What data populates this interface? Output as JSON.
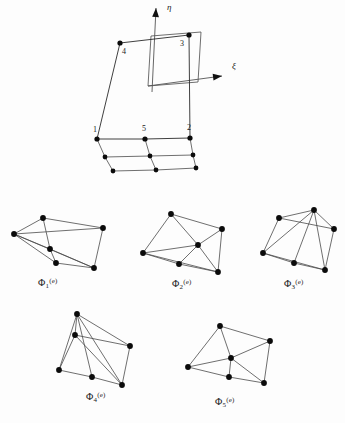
{
  "figure": {
    "background_color": "#fdfdfd",
    "line_color": "#4a4a4a",
    "node_color": "#0b0b0b"
  },
  "main_diagram": {
    "name": "parent-element-with-axes",
    "axes": [
      {
        "id": "eta",
        "label": "η",
        "label_x": 167,
        "label_y": 10,
        "x1": 152,
        "y1": 92,
        "x2": 156,
        "y2": 8,
        "arrow": "up"
      },
      {
        "id": "xi",
        "label": "ξ",
        "label_x": 232,
        "label_y": 69,
        "x1": 148,
        "y1": 86,
        "x2": 222,
        "y2": 76,
        "arrow": "right"
      }
    ],
    "inner_square": {
      "x1": 148,
      "y1": 86,
      "x2": 151,
      "y2": 36,
      "x3": 201,
      "y3": 32,
      "x4": 198,
      "y4": 82
    },
    "top_face": [
      {
        "id": "1",
        "label": "1",
        "x": 97,
        "y": 139,
        "label_x": 93,
        "label_y": 132
      },
      {
        "id": "5",
        "label": "5",
        "x": 145,
        "y": 139,
        "label_x": 142,
        "label_y": 131
      },
      {
        "id": "2",
        "label": "2",
        "x": 190,
        "y": 138,
        "label_x": 187,
        "label_y": 130
      },
      {
        "id": "3",
        "label": "3",
        "x": 189,
        "y": 35,
        "label_x": 180,
        "label_y": 46
      },
      {
        "id": "4",
        "label": "4",
        "x": 120,
        "y": 43,
        "label_x": 122,
        "label_y": 54
      }
    ],
    "prism_rows": [
      {
        "id": "row-mid",
        "points": [
          {
            "x": 105,
            "y": 157
          },
          {
            "x": 150,
            "y": 156
          },
          {
            "x": 193,
            "y": 155
          }
        ]
      },
      {
        "id": "row-bottom",
        "points": [
          {
            "x": 113,
            "y": 171
          },
          {
            "x": 156,
            "y": 170
          },
          {
            "x": 196,
            "y": 168
          }
        ]
      }
    ]
  },
  "shape_plots": [
    {
      "id": "phi1",
      "name": "shape-function-plot-phi1",
      "label_html": "Φ<sub>1</sub><sup>(e)</sup>",
      "label_x": 38,
      "label_y": 277,
      "origin_x": 8,
      "origin_y": 196,
      "nodes": [
        {
          "id": "n1",
          "x": 6,
          "y": 38
        },
        {
          "id": "n2",
          "x": 42,
          "y": 53
        },
        {
          "id": "n3",
          "x": 35,
          "y": 22
        },
        {
          "id": "n4",
          "x": 95,
          "y": 32
        },
        {
          "id": "n5",
          "x": 86,
          "y": 72
        },
        {
          "id": "n6",
          "x": 48,
          "y": 67
        }
      ],
      "edges": [
        [
          "n3",
          "n1"
        ],
        [
          "n3",
          "n4"
        ],
        [
          "n4",
          "n5"
        ],
        [
          "n5",
          "n2"
        ],
        [
          "n2",
          "n1"
        ],
        [
          "n1",
          "n4"
        ],
        [
          "n1",
          "n5"
        ],
        [
          "n1",
          "n6"
        ],
        [
          "n3",
          "n2"
        ],
        [
          "n6",
          "n5"
        ],
        [
          "n2",
          "n6"
        ]
      ]
    },
    {
      "id": "phi2",
      "name": "shape-function-plot-phi2",
      "label_html": "Φ<sub>2</sub><sup>(e)</sup>",
      "label_x": 172,
      "label_y": 278,
      "origin_x": 140,
      "origin_y": 200,
      "nodes": [
        {
          "id": "n1",
          "x": 3,
          "y": 53
        },
        {
          "id": "n2",
          "x": 31,
          "y": 14
        },
        {
          "id": "n3",
          "x": 82,
          "y": 29
        },
        {
          "id": "n4",
          "x": 78,
          "y": 72
        },
        {
          "id": "n5",
          "x": 58,
          "y": 45
        },
        {
          "id": "n6",
          "x": 39,
          "y": 64
        }
      ],
      "edges": [
        [
          "n1",
          "n2"
        ],
        [
          "n2",
          "n3"
        ],
        [
          "n3",
          "n4"
        ],
        [
          "n4",
          "n1"
        ],
        [
          "n2",
          "n5"
        ],
        [
          "n5",
          "n1"
        ],
        [
          "n5",
          "n3"
        ],
        [
          "n5",
          "n4"
        ],
        [
          "n1",
          "n6"
        ],
        [
          "n6",
          "n5"
        ],
        [
          "n6",
          "n4"
        ]
      ]
    },
    {
      "id": "phi3",
      "name": "shape-function-plot-phi3",
      "label_html": "Φ<sub>3</sub><sup>(e)</sup>",
      "label_x": 284,
      "label_y": 278,
      "origin_x": 252,
      "origin_y": 198,
      "nodes": [
        {
          "id": "n1",
          "x": 11,
          "y": 55
        },
        {
          "id": "n2",
          "x": 27,
          "y": 20
        },
        {
          "id": "n3",
          "x": 62,
          "y": 12
        },
        {
          "id": "n4",
          "x": 82,
          "y": 31
        },
        {
          "id": "n5",
          "x": 73,
          "y": 72
        },
        {
          "id": "n6",
          "x": 42,
          "y": 65
        }
      ],
      "edges": [
        [
          "n1",
          "n2"
        ],
        [
          "n2",
          "n3"
        ],
        [
          "n3",
          "n4"
        ],
        [
          "n4",
          "n5"
        ],
        [
          "n5",
          "n1"
        ],
        [
          "n2",
          "n4"
        ],
        [
          "n3",
          "n1"
        ],
        [
          "n3",
          "n5"
        ],
        [
          "n3",
          "n6"
        ],
        [
          "n1",
          "n6"
        ],
        [
          "n6",
          "n5"
        ]
      ]
    },
    {
      "id": "phi4",
      "name": "shape-function-plot-phi4",
      "label_html": "Φ<sub>4</sub><sup>(e)</sup>",
      "label_x": 86,
      "label_y": 391,
      "origin_x": 52,
      "origin_y": 310,
      "nodes": [
        {
          "id": "n1",
          "x": 7,
          "y": 60
        },
        {
          "id": "n2",
          "x": 25,
          "y": 4
        },
        {
          "id": "n3",
          "x": 23,
          "y": 25
        },
        {
          "id": "n4",
          "x": 78,
          "y": 36
        },
        {
          "id": "n5",
          "x": 70,
          "y": 75
        },
        {
          "id": "n6",
          "x": 40,
          "y": 67
        }
      ],
      "edges": [
        [
          "n2",
          "n3"
        ],
        [
          "n3",
          "n1"
        ],
        [
          "n1",
          "n6"
        ],
        [
          "n6",
          "n5"
        ],
        [
          "n5",
          "n4"
        ],
        [
          "n4",
          "n2"
        ],
        [
          "n2",
          "n1"
        ],
        [
          "n2",
          "n5"
        ],
        [
          "n2",
          "n6"
        ],
        [
          "n3",
          "n4"
        ],
        [
          "n3",
          "n5"
        ]
      ]
    },
    {
      "id": "phi5",
      "name": "shape-function-plot-phi5",
      "label_html": "Φ<sub>5</sub><sup>(e)</sup>",
      "label_x": 215,
      "label_y": 396,
      "origin_x": 182,
      "origin_y": 315,
      "nodes": [
        {
          "id": "n1",
          "x": 6,
          "y": 52
        },
        {
          "id": "n2",
          "x": 38,
          "y": 11
        },
        {
          "id": "n3",
          "x": 88,
          "y": 26
        },
        {
          "id": "n4",
          "x": 82,
          "y": 68
        },
        {
          "id": "n5",
          "x": 49,
          "y": 43
        },
        {
          "id": "n6",
          "x": 47,
          "y": 62
        }
      ],
      "edges": [
        [
          "n1",
          "n2"
        ],
        [
          "n2",
          "n3"
        ],
        [
          "n3",
          "n4"
        ],
        [
          "n4",
          "n6"
        ],
        [
          "n6",
          "n1"
        ],
        [
          "n2",
          "n5"
        ],
        [
          "n5",
          "n1"
        ],
        [
          "n5",
          "n3"
        ],
        [
          "n5",
          "n4"
        ],
        [
          "n5",
          "n6"
        ]
      ]
    }
  ]
}
